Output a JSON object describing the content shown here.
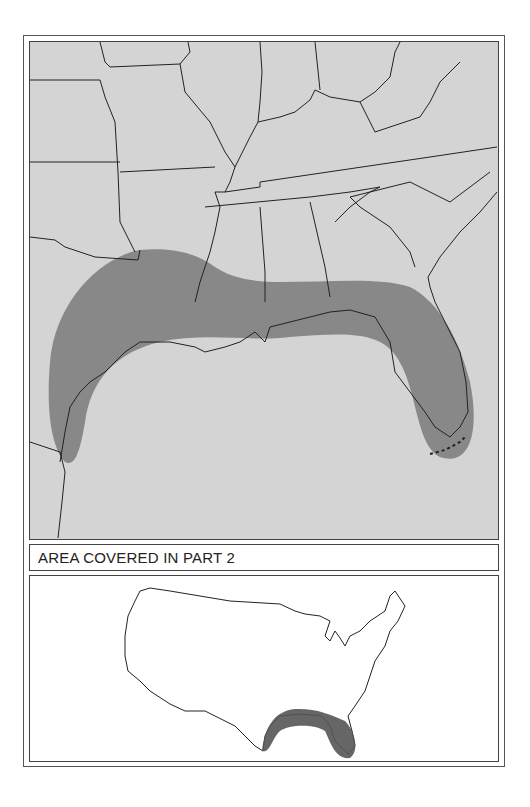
{
  "map": {
    "title": "Regional map of southeastern United States",
    "highlight_color": "#7a7a7a",
    "land_color": "#d4d4d4",
    "highlighted_region": "Gulf Coast from southern Texas through Louisiana, Mississippi, Alabama and Florida"
  },
  "caption": {
    "text": "AREA COVERED IN PART 2"
  },
  "inset": {
    "title": "Locator map of contiguous United States",
    "highlight_color": "#555555"
  }
}
